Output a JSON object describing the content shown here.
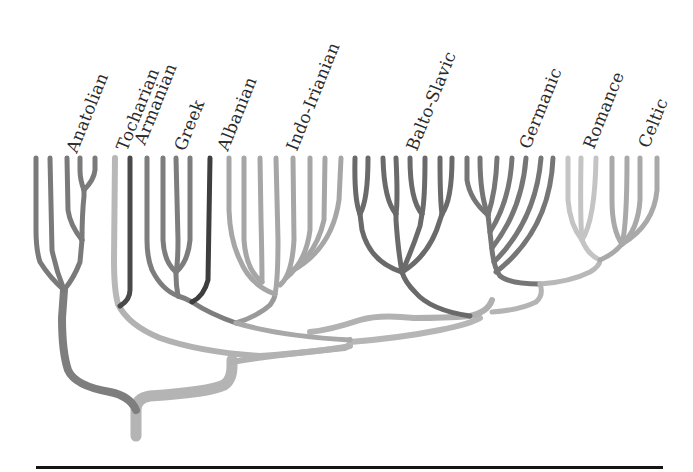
{
  "labels": [
    {
      "text": "Anatolian",
      "x": 62,
      "y": 148
    },
    {
      "text": "Tocharian",
      "x": 112,
      "y": 146
    },
    {
      "text": "Armanian",
      "x": 130,
      "y": 140
    },
    {
      "text": "Greek",
      "x": 170,
      "y": 146
    },
    {
      "text": "Albanian",
      "x": 213,
      "y": 146
    },
    {
      "text": "Indo-Irianian",
      "x": 282,
      "y": 146
    },
    {
      "text": "Balto-Slavic",
      "x": 402,
      "y": 146
    },
    {
      "text": "Germanic",
      "x": 515,
      "y": 144
    },
    {
      "text": "Romance",
      "x": 579,
      "y": 144
    },
    {
      "text": "Celtic",
      "x": 634,
      "y": 143
    }
  ],
  "colors": {
    "anatolian": "#7a7a7a",
    "tocharian": "#b8b8b8",
    "armenian": "#4a4a4a",
    "greek": "#7d7d7d",
    "albanian": "#3e3e3e",
    "indo_iranian": "#a6a6a6",
    "balto_slavic": "#6a6a6a",
    "germanic": "#767676",
    "romance": "#c4c4c4",
    "celtic": "#a9a9a9",
    "trunk": "#b0b0b0",
    "baseline": "#141414"
  },
  "branches": [
    "Anatolian",
    "Tocharian",
    "Armenian",
    "Greek",
    "Albanian",
    "Indo-Iranian",
    "Balto-Slavic",
    "Germanic",
    "Romance",
    "Celtic"
  ]
}
